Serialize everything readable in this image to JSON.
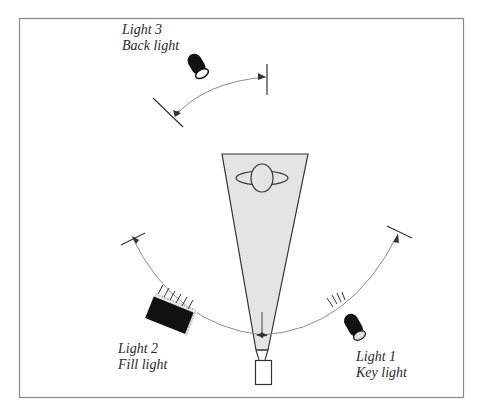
{
  "diagram": {
    "colors": {
      "frame": "#8a8a8a",
      "cone_fill": "#e4e4e4",
      "stroke": "#333333",
      "arc": "#8c8c8c",
      "light_body": "#111111"
    },
    "lights": [
      {
        "id": "light1",
        "name": "Light 1",
        "role": "Key light"
      },
      {
        "id": "light2",
        "name": "Light 2",
        "role": "Fill light"
      },
      {
        "id": "light3",
        "name": "Light 3",
        "role": "Back light"
      }
    ],
    "elements": {
      "subject": "subject-head-top-view",
      "camera": "camera",
      "field_of_view": "camera-view-cone"
    }
  }
}
